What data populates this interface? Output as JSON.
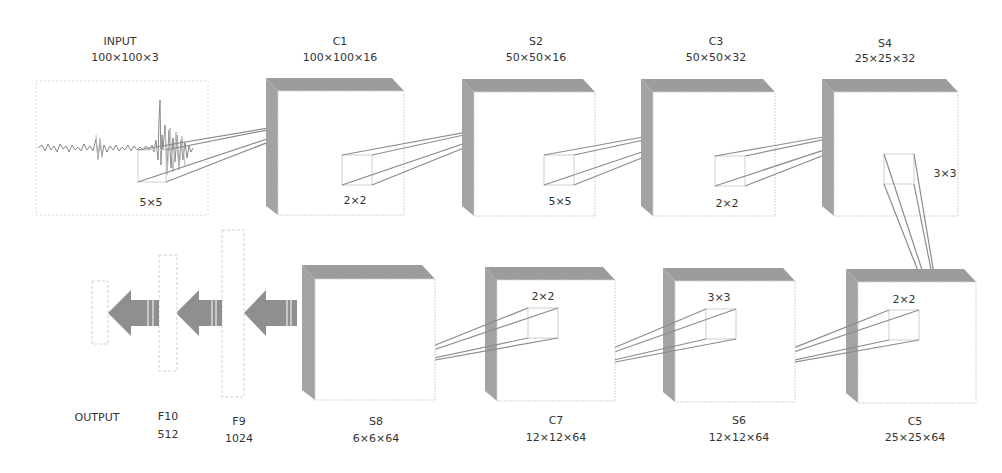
{
  "diagram": {
    "type": "cnn-architecture",
    "colors": {
      "block_side": "#a3a3a3",
      "block_top": "#9c9c9c",
      "rays": "#8c8c8c",
      "arrows": "#8f8f8f",
      "text": "#333333"
    },
    "input": {
      "name": "INPUT",
      "dims": "100×100×3",
      "kernel": "5×5"
    },
    "layers_top": [
      {
        "name": "C1",
        "dims": "100×100×16",
        "kernel": "2×2"
      },
      {
        "name": "S2",
        "dims": "50×50×16",
        "kernel": "5×5"
      },
      {
        "name": "C3",
        "dims": "50×50×32",
        "kernel": "2×2"
      },
      {
        "name": "S4",
        "dims": "25×25×32",
        "kernel": "3×3"
      }
    ],
    "layers_bottom": [
      {
        "name": "C5",
        "dims": "25×25×64",
        "kernel": "2×2"
      },
      {
        "name": "S6",
        "dims": "12×12×64",
        "kernel": "3×3"
      },
      {
        "name": "C7",
        "dims": "12×12×64",
        "kernel": "2×2"
      },
      {
        "name": "S8",
        "dims": "6×6×64"
      }
    ],
    "fully_connected": [
      {
        "name": "F9",
        "dims": "1024"
      },
      {
        "name": "F10",
        "dims": "512"
      }
    ],
    "output": {
      "name": "OUTPUT"
    }
  }
}
